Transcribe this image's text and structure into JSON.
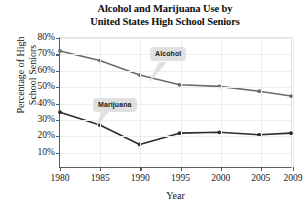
{
  "chart_data": {
    "type": "line",
    "title": "Alcohol and Marijuana Use by United States High School Seniors",
    "title_line1": "Alcohol and Marijuana Use by",
    "title_line2": "United States High School Seniors",
    "xlabel": "Year",
    "ylabel": "Percentage of High School Seniors",
    "ylabel_line1": "Percentage of High",
    "ylabel_line2": "School Seniors",
    "x": [
      1980,
      1985,
      1990,
      1995,
      2000,
      2005,
      2009
    ],
    "categories": [
      "1980",
      "1985",
      "1990",
      "1995",
      "2000",
      "2005",
      "2009"
    ],
    "xtick_labels": [
      "1980",
      "1985",
      "1990",
      "1995",
      "2000",
      "2005",
      "2009"
    ],
    "ytick_labels": [
      "10%",
      "20%",
      "30%",
      "40%",
      "50%",
      "60%",
      "70%",
      "80%"
    ],
    "ytick_values": [
      10,
      20,
      30,
      40,
      50,
      60,
      70,
      80
    ],
    "xlim": [
      1980,
      2009
    ],
    "ylim": [
      0,
      80
    ],
    "grid": true,
    "legend": "annotations",
    "series": [
      {
        "name": "Alcohol",
        "color": "#6b6b6b",
        "values": [
          72,
          66,
          57,
          51,
          50,
          47,
          44
        ]
      },
      {
        "name": "Marijuana",
        "color": "#2b2b2b",
        "values": [
          34,
          26,
          14,
          21,
          21.5,
          20,
          21
        ]
      }
    ],
    "annotations": [
      {
        "text": "Alcohol",
        "series": "Alcohol"
      },
      {
        "text": "Marijuana",
        "series": "Marijuana"
      }
    ]
  }
}
